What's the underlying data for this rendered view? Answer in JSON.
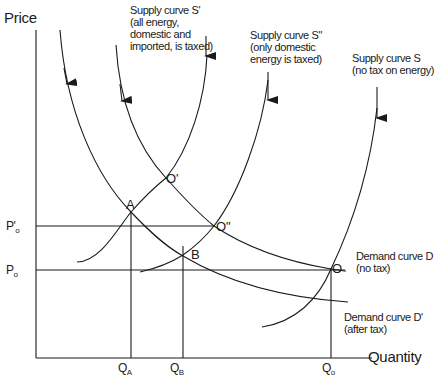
{
  "axes": {
    "y_label": "Price",
    "x_label": "Quantity"
  },
  "price_ticks": [
    {
      "main": "P",
      "sub": "o",
      "prime": "'",
      "label": "P'o"
    },
    {
      "main": "P",
      "sub": "o",
      "prime": "",
      "label": "Po"
    }
  ],
  "quantity_ticks": [
    {
      "main": "Q",
      "sub": "A",
      "label": "QA"
    },
    {
      "main": "Q",
      "sub": "B",
      "label": "QB"
    },
    {
      "main": "Q",
      "sub": "o",
      "label": "Qo"
    }
  ],
  "curves": {
    "supply_s_prime": {
      "lines": [
        "Supply curve S'",
        "(all energy,",
        "domestic and",
        "imported, is taxed)"
      ]
    },
    "supply_s_double_prime": {
      "lines": [
        "Supply curve S\"",
        "(only domestic",
        "energy is taxed)"
      ]
    },
    "supply_s": {
      "lines": [
        "Supply curve S",
        "(no tax on energy)"
      ]
    },
    "demand_d": {
      "lines": [
        "Demand curve D",
        "(no tax)"
      ]
    },
    "demand_d_prime": {
      "lines": [
        "Demand curve D'",
        "(after tax)"
      ]
    }
  },
  "points": {
    "o_prime": "O'",
    "o_double_prime": "O\"",
    "a": "A",
    "b": "B",
    "o": "O"
  },
  "colors": {
    "line": "#1a1a1a",
    "background": "#ffffff"
  }
}
